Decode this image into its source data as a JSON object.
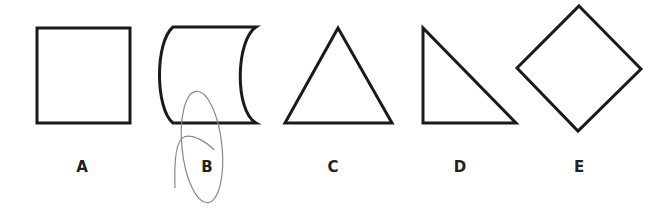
{
  "shapes": [
    {
      "id": "A",
      "label": "A",
      "kind": "square"
    },
    {
      "id": "B",
      "label": "B",
      "kind": "cylinder-side"
    },
    {
      "id": "C",
      "label": "C",
      "kind": "equilateral-triangle"
    },
    {
      "id": "D",
      "label": "D",
      "kind": "right-triangle"
    },
    {
      "id": "E",
      "label": "E",
      "kind": "diamond"
    }
  ],
  "annotation": {
    "circled_label": "B",
    "stroke_color": "#888888"
  },
  "colors": {
    "outline": "#1a1a1a",
    "background": "#ffffff"
  }
}
